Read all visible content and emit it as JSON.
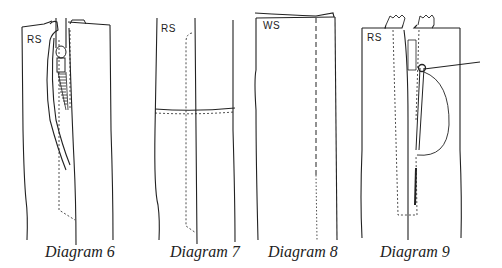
{
  "figure": {
    "diagrams": [
      {
        "id": "6",
        "caption": "Diagram 6",
        "side_label": "RS"
      },
      {
        "id": "7",
        "caption": "Diagram 7",
        "side_label": "RS"
      },
      {
        "id": "8",
        "caption": "Diagram 8",
        "side_label": "WS"
      },
      {
        "id": "9",
        "caption": "Diagram 9",
        "side_label": "RS"
      }
    ],
    "colors": {
      "ink": "#222222",
      "background": "#ffffff"
    }
  }
}
